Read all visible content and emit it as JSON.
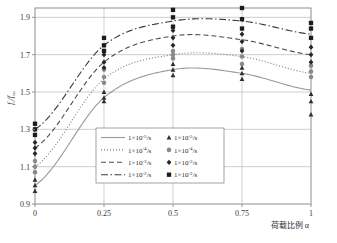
{
  "chart_data": {
    "type": "line",
    "title": "",
    "xlabel": "荷载比例 α",
    "ylabel": "fc/fcu",
    "xlim": [
      0,
      1
    ],
    "ylim": [
      0.9,
      1.95
    ],
    "xticks": [
      "0",
      "0.25",
      "0.5",
      "0.75",
      "1"
    ],
    "xtickvals": [
      0,
      0.25,
      0.5,
      0.75,
      1
    ],
    "yticks": [
      "0.9",
      "1.1",
      "1.3",
      "1.5",
      "1.7",
      "1.9"
    ],
    "ytickvals": [
      0.9,
      1.1,
      1.3,
      1.5,
      1.7,
      1.9
    ],
    "grid": true,
    "legend_position": "lower-center",
    "x": [
      0,
      0.25,
      0.5,
      0.75,
      1
    ],
    "series": [
      {
        "name": "1×10⁻⁵/s",
        "rate_mantissa": "1",
        "rate_exponent": "-5",
        "unit": "/s",
        "linestyle": "solid",
        "marker": "triangle",
        "color": "#9a9a9a",
        "marker_color": "#2e2e2e",
        "values": [
          1.0,
          1.47,
          1.62,
          1.6,
          1.51
        ],
        "scatter": [
          [
            0.97,
            1.0,
            1.03
          ],
          [
            1.45,
            1.47,
            1.5
          ],
          [
            1.59,
            1.62,
            1.65
          ],
          [
            1.57,
            1.6,
            1.63
          ],
          [
            1.38,
            1.45,
            1.49
          ]
        ]
      },
      {
        "name": "1×10⁻⁴/s",
        "rate_mantissa": "1",
        "rate_exponent": "-4",
        "unit": "/s",
        "linestyle": "dotted",
        "marker": "circle",
        "color": "#777777",
        "marker_color": "#8a8a8a",
        "values": [
          1.1,
          1.57,
          1.7,
          1.69,
          1.6
        ],
        "scatter": [
          [
            1.07,
            1.1,
            1.13
          ],
          [
            1.55,
            1.58,
            1.62
          ],
          [
            1.68,
            1.7,
            1.72
          ],
          [
            1.65,
            1.69,
            1.73
          ],
          [
            1.58,
            1.61,
            1.64
          ]
        ]
      },
      {
        "name": "1×10⁻³/s",
        "rate_mantissa": "1",
        "rate_exponent": "-3",
        "unit": "/s",
        "linestyle": "dashed",
        "marker": "diamond",
        "color": "#4d4d4d",
        "marker_color": "#262626",
        "values": [
          1.2,
          1.66,
          1.8,
          1.78,
          1.7
        ],
        "scatter": [
          [
            1.17,
            1.2,
            1.23
          ],
          [
            1.63,
            1.66,
            1.7
          ],
          [
            1.75,
            1.79,
            1.83
          ],
          [
            1.72,
            1.77,
            1.81
          ],
          [
            1.66,
            1.7,
            1.74
          ]
        ]
      },
      {
        "name": "1×10⁻²/s",
        "rate_mantissa": "1",
        "rate_exponent": "-2",
        "unit": "/s",
        "linestyle": "dashdot",
        "marker": "square",
        "color": "#3a3a3a",
        "marker_color": "#1c1c1c",
        "values": [
          1.3,
          1.75,
          1.88,
          1.88,
          1.81
        ],
        "scatter": [
          [
            1.27,
            1.3,
            1.33
          ],
          [
            1.72,
            1.75,
            1.79
          ],
          [
            1.85,
            1.9,
            1.94
          ],
          [
            1.84,
            1.89,
            1.95
          ],
          [
            1.79,
            1.84,
            1.87
          ]
        ]
      }
    ],
    "legend_line_entries": [
      {
        "label": "1×10⁻⁵/s",
        "mantissa": "1",
        "exp": "-5",
        "unit": "/s",
        "style": "solid"
      },
      {
        "label": "1×10⁻⁴/s",
        "mantissa": "1",
        "exp": "-4",
        "unit": "/s",
        "style": "dotted"
      },
      {
        "label": "1×10⁻³/s",
        "mantissa": "1",
        "exp": "-3",
        "unit": "/s",
        "style": "dashed"
      },
      {
        "label": "1×10⁻²/s",
        "mantissa": "1",
        "exp": "-2",
        "unit": "/s",
        "style": "dashdot"
      }
    ],
    "legend_marker_entries": [
      {
        "label": "1×10⁻⁵/s",
        "mantissa": "1",
        "exp": "-5",
        "unit": "/s",
        "marker": "triangle"
      },
      {
        "label": "1×10⁻⁴/s",
        "mantissa": "1",
        "exp": "-4",
        "unit": "/s",
        "marker": "circle"
      },
      {
        "label": "1×10⁻³/s",
        "mantissa": "1",
        "exp": "-3",
        "unit": "/s",
        "marker": "diamond"
      },
      {
        "label": "1×10⁻²/s",
        "mantissa": "1",
        "exp": "-2",
        "unit": "/s",
        "marker": "square"
      }
    ],
    "ylabel_parts": {
      "num": "f",
      "num_sub": "c",
      "slash": "/",
      "den": "f",
      "den_sub": "cu"
    }
  }
}
